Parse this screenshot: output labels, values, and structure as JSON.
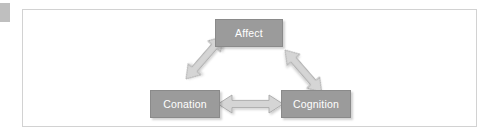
{
  "page": {
    "background_color": "#ffffff",
    "frame_border_color": "#d2d2d2",
    "margin_marker_color": "#bfbfbf"
  },
  "diagram": {
    "type": "triangle-relationship",
    "node_fill_color": "#9b9b9b",
    "node_text_color": "#ffffff",
    "arrow_fill_color": "#d5d5d5",
    "arrow_stroke_color": "#a8a8a8",
    "nodes": [
      {
        "id": "affect",
        "label": "Affect",
        "position": "top-center"
      },
      {
        "id": "conation",
        "label": "Conation",
        "position": "bottom-left"
      },
      {
        "id": "cognition",
        "label": "Cognition",
        "position": "bottom-right"
      }
    ],
    "connections": [
      {
        "from": "affect",
        "to": "conation",
        "style": "double-headed-block-arrow"
      },
      {
        "from": "affect",
        "to": "cognition",
        "style": "double-headed-block-arrow"
      },
      {
        "from": "conation",
        "to": "cognition",
        "style": "double-headed-block-arrow"
      }
    ]
  }
}
